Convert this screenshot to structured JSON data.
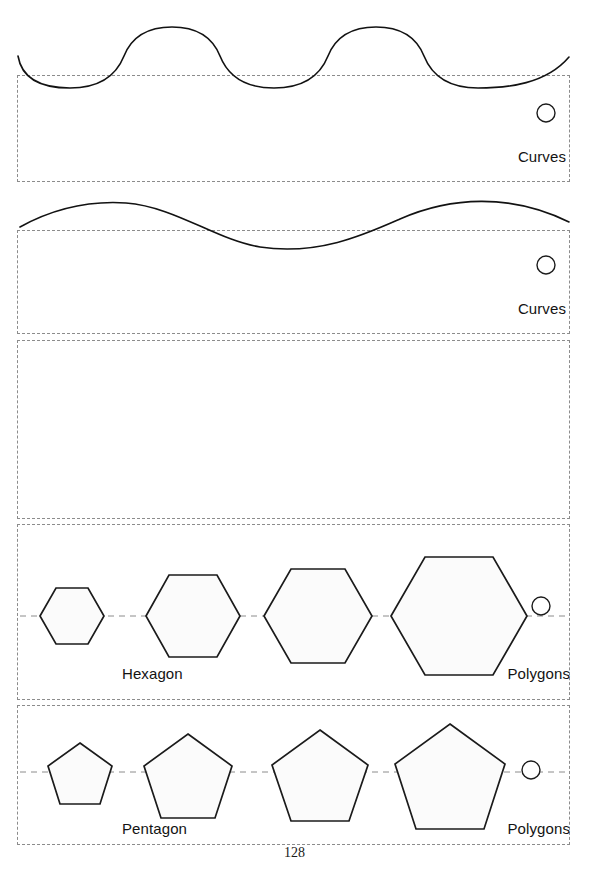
{
  "page": {
    "width": 589,
    "height": 870,
    "background": "#ffffff",
    "page_number": "128"
  },
  "colors": {
    "frame_dash": "#8c8c8c",
    "stroke": "#121212",
    "shape_fill": "#fbfbfb",
    "shape_stroke": "#1b1b1b",
    "text": "#131313"
  },
  "sections": [
    {
      "id": "curves-scalloped",
      "kind": "curve",
      "frame": {
        "x": 17,
        "y": 75,
        "width": 553,
        "height": 107
      },
      "caption_right": "Curves",
      "handle_icon": "resize-handle-circle",
      "curve_description": "scalloped repeating wave with three crests"
    },
    {
      "id": "curves-sine",
      "kind": "curve",
      "frame": {
        "x": 17,
        "y": 230,
        "width": 553,
        "height": 104
      },
      "caption_right": "Curves",
      "handle_icon": "resize-handle-circle",
      "curve_description": "single smooth sine wave, one crest and one trough"
    },
    {
      "id": "empty-section",
      "kind": "empty",
      "frame": {
        "x": 17,
        "y": 340,
        "width": 553,
        "height": 179
      },
      "caption_right": "",
      "handle_icon": ""
    },
    {
      "id": "polygons-hexagon",
      "kind": "polygons",
      "frame": {
        "x": 17,
        "y": 524,
        "width": 553,
        "height": 176
      },
      "caption_left": "Hexagon",
      "caption_right": "Polygons",
      "handle_icon": "resize-handle-circle",
      "shape": "hexagon",
      "sides": 6,
      "axis_y": 616,
      "items": [
        {
          "cx": 72,
          "r": 32
        },
        {
          "cx": 193,
          "r": 47
        },
        {
          "cx": 318,
          "r": 54
        },
        {
          "cx": 459,
          "r": 68
        }
      ]
    },
    {
      "id": "polygons-pentagon",
      "kind": "polygons",
      "frame": {
        "x": 17,
        "y": 705,
        "width": 553,
        "height": 140
      },
      "caption_left": "Pentagon",
      "caption_right": "Polygons",
      "handle_icon": "resize-handle-circle",
      "shape": "pentagon",
      "sides": 5,
      "axis_y": 772,
      "items": [
        {
          "cx": 80,
          "r": 34
        },
        {
          "cx": 188,
          "r": 46
        },
        {
          "cx": 320,
          "r": 50
        },
        {
          "cx": 450,
          "r": 58
        }
      ]
    }
  ],
  "labels": {
    "curves_1": "Curves",
    "curves_2": "Curves",
    "hexagon": "Hexagon",
    "polygons_hex": "Polygons",
    "pentagon": "Pentagon",
    "polygons_pent": "Polygons",
    "page_number": "128"
  }
}
